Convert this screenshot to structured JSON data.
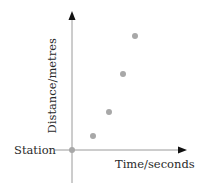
{
  "diagram": {
    "y_axis_label": "Distance/metres",
    "x_axis_label": "Time/seconds",
    "origin_label": "Station",
    "colors": {
      "axis": "#9a9a9a",
      "arrowhead": "#111111",
      "point": "#a8a8a8",
      "text": "#2a2a2a"
    }
  },
  "chart_data": {
    "type": "scatter",
    "title": "",
    "xlabel": "Time/seconds",
    "ylabel": "Distance/metres",
    "origin_label": "Station",
    "grid": false,
    "points": [
      {
        "x": 0,
        "y": 0
      },
      {
        "x": 1,
        "y": 1
      },
      {
        "x": 2,
        "y": 2.5
      },
      {
        "x": 3,
        "y": 5
      },
      {
        "x": 4,
        "y": 7.5
      }
    ],
    "pixel_points": [
      {
        "x": 72,
        "y": 150
      },
      {
        "x": 93,
        "y": 136
      },
      {
        "x": 109,
        "y": 112
      },
      {
        "x": 123,
        "y": 74
      },
      {
        "x": 135,
        "y": 36
      }
    ]
  }
}
